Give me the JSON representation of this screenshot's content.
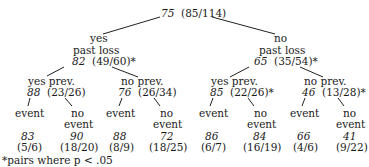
{
  "root": {
    "pct": "75",
    "frac": "(85/114)"
  },
  "branches": {
    "left": {
      "label_top": "yes",
      "label": "past loss",
      "pct": "82",
      "frac": "(49/60)*",
      "children": {
        "yes_prev": {
          "label": "yes prev.",
          "pct": "88",
          "frac": "(23/26)",
          "event": {
            "label": "event",
            "pct": "83",
            "frac": "(5/6)"
          },
          "no_event": {
            "label1": "no",
            "label2": "event",
            "pct": "90",
            "frac": "(18/20)"
          }
        },
        "no_prev": {
          "label": "no prev.",
          "pct": "76",
          "frac": "(26/34)",
          "event": {
            "label": "event",
            "pct": "88",
            "frac": "(8/9)"
          },
          "no_event": {
            "label1": "no",
            "label2": "event",
            "pct": "72",
            "frac": "(18/25)"
          }
        }
      }
    },
    "right": {
      "label_top": "no",
      "label": "past loss",
      "pct": "65",
      "frac": "(35/54)*",
      "children": {
        "yes_prev": {
          "label": "yes prev.",
          "pct": "85",
          "frac": "(22/26)*",
          "event": {
            "label": "event",
            "pct": "86",
            "frac": "(6/7)"
          },
          "no_event": {
            "label1": "no",
            "label2": "event",
            "pct": "84",
            "frac": "(16/19)"
          }
        },
        "no_prev": {
          "label": "no prev.",
          "pct": "46",
          "frac": "(13/28)*",
          "event": {
            "label": "event",
            "pct": "66",
            "frac": "(4/6)"
          },
          "no_event": {
            "label1": "no",
            "label2": "event",
            "pct": "41",
            "frac": "(9/22)"
          }
        }
      }
    }
  },
  "footnote": "*pairs where p < .05"
}
